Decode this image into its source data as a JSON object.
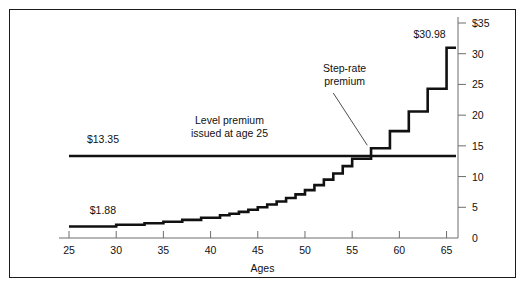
{
  "chart_data": {
    "type": "line",
    "title": "",
    "subtitle": "",
    "xlabel": "Ages",
    "ylabel": "",
    "xlim": [
      25,
      66
    ],
    "ylim": [
      0,
      35
    ],
    "xticks": [
      25,
      30,
      35,
      40,
      45,
      50,
      55,
      60,
      65
    ],
    "xtick_labels": [
      "25",
      "30",
      "35",
      "40",
      "45",
      "50",
      "55",
      "60",
      "65"
    ],
    "yticks": [
      0,
      5,
      10,
      15,
      20,
      25,
      30,
      35
    ],
    "ytick_labels": [
      "0",
      "5",
      "10",
      "15",
      "20",
      "25",
      "30",
      "$35"
    ],
    "grid": false,
    "legend_position": "none",
    "axis_position": "right",
    "series": [
      {
        "name": "Step-rate premium",
        "style": "step",
        "x": [
          25,
          30,
          33,
          35,
          37,
          39,
          41,
          42,
          43,
          44,
          45,
          46,
          47,
          48,
          49,
          50,
          51,
          52,
          53,
          54,
          55,
          57,
          59,
          61,
          63,
          65,
          66
        ],
        "values": [
          1.88,
          2.15,
          2.4,
          2.65,
          2.95,
          3.3,
          3.7,
          3.95,
          4.25,
          4.6,
          5.0,
          5.45,
          5.95,
          6.5,
          7.1,
          7.8,
          8.6,
          9.5,
          10.5,
          11.7,
          12.9,
          14.6,
          17.4,
          20.6,
          24.3,
          30.98,
          30.98
        ]
      },
      {
        "name": "Level premium issued at age 25",
        "style": "flat",
        "x": [
          25,
          66
        ],
        "values": [
          13.35,
          13.35
        ]
      }
    ],
    "annotations": [
      {
        "id": "low-value",
        "text": "$1.88",
        "x": 27.2,
        "y": 3.9
      },
      {
        "id": "level-value",
        "text": "$13.35",
        "x": 26.9,
        "y": 15.4
      },
      {
        "id": "high-value",
        "text": "$30.98",
        "x": 61.5,
        "y": 32.6
      },
      {
        "id": "level-note-line1",
        "text": "Level premium",
        "x": 42.0,
        "y": 18.6
      },
      {
        "id": "level-note-line2",
        "text": "issued at age 25",
        "x": 42.0,
        "y": 16.5
      },
      {
        "id": "step-note-line1",
        "text": "Step-rate",
        "x": 54.2,
        "y": 27.0
      },
      {
        "id": "step-note-line2",
        "text": "premium",
        "x": 54.2,
        "y": 24.9
      }
    ],
    "leader_line": {
      "x1": 53.0,
      "y1": 23.6,
      "x2": 56.6,
      "y2": 15.1
    },
    "colors": {
      "frame": "#1b1b1b",
      "axis": "#6d6d6d",
      "series_line": "#111111",
      "background": "#ffffff",
      "text": "#111111"
    }
  }
}
